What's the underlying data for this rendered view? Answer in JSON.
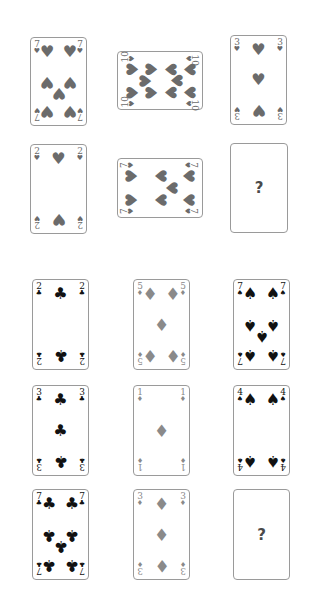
{
  "puzzle": {
    "top_grid": {
      "cards": [
        {
          "rank": "7",
          "suit": "♥",
          "suit_name": "hearts",
          "orientation": "portrait",
          "color": "#6b6b6b"
        },
        {
          "rank": "10",
          "suit": "♥",
          "suit_name": "hearts",
          "orientation": "landscape",
          "color": "#6b6b6b"
        },
        {
          "rank": "3",
          "suit": "♥",
          "suit_name": "hearts",
          "orientation": "portrait",
          "color": "#6b6b6b"
        },
        {
          "rank": "2",
          "suit": "♥",
          "suit_name": "hearts",
          "orientation": "portrait",
          "color": "#6b6b6b"
        },
        {
          "rank": "7",
          "suit": "♥",
          "suit_name": "hearts",
          "orientation": "landscape",
          "color": "#6b6b6b"
        },
        {
          "rank": "?",
          "suit": "",
          "suit_name": "unknown",
          "orientation": "portrait",
          "color": "#4a4a4a"
        }
      ]
    },
    "bottom_grid": {
      "cards": [
        {
          "rank": "2",
          "suit": "♣",
          "suit_name": "clubs",
          "color": "#111111"
        },
        {
          "rank": "5",
          "suit": "♦",
          "suit_name": "diamonds",
          "color": "#8a8a8a"
        },
        {
          "rank": "7",
          "suit": "♠",
          "suit_name": "spades",
          "color": "#111111"
        },
        {
          "rank": "3",
          "suit": "♣",
          "suit_name": "clubs",
          "color": "#111111"
        },
        {
          "rank": "1",
          "suit": "♦",
          "suit_name": "diamonds",
          "color": "#8a8a8a"
        },
        {
          "rank": "4",
          "suit": "♠",
          "suit_name": "spades",
          "color": "#111111"
        },
        {
          "rank": "7",
          "suit": "♣",
          "suit_name": "clubs",
          "color": "#111111"
        },
        {
          "rank": "3",
          "suit": "♦",
          "suit_name": "diamonds",
          "color": "#8a8a8a"
        },
        {
          "rank": "?",
          "suit": "",
          "suit_name": "unknown",
          "color": "#4a4a4a"
        }
      ]
    },
    "unknown_label": "?"
  }
}
